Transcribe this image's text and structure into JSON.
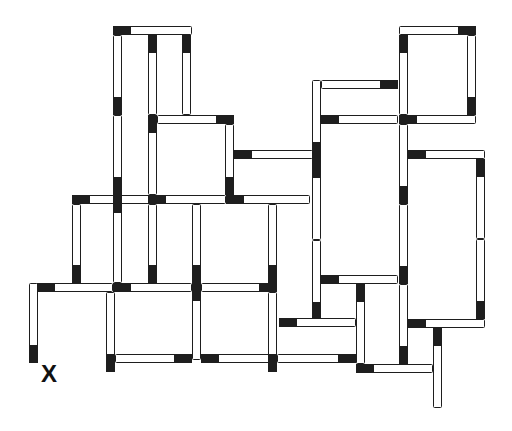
{
  "diagram": {
    "stick_thickness": 9,
    "head_length": 18,
    "colors": {
      "head": "#1e1e1e",
      "outline": "#1e1e1e",
      "body": "#ffffff",
      "background": "#ffffff"
    },
    "label": {
      "text": "X",
      "x": 41,
      "y": 362,
      "size": 24
    },
    "sticks": [
      {
        "x": 113,
        "y": 26,
        "w": 79,
        "h": 9,
        "head": "start"
      },
      {
        "x": 113,
        "y": 35,
        "w": 9,
        "h": 80,
        "head": "end"
      },
      {
        "x": 113,
        "y": 115,
        "w": 9,
        "h": 80,
        "head": "end"
      },
      {
        "x": 148,
        "y": 35,
        "w": 9,
        "h": 80,
        "head": "start"
      },
      {
        "x": 182,
        "y": 35,
        "w": 9,
        "h": 80,
        "head": "start"
      },
      {
        "x": 148,
        "y": 115,
        "w": 9,
        "h": 80,
        "head": "start"
      },
      {
        "x": 157,
        "y": 115,
        "w": 77,
        "h": 9,
        "head": "end"
      },
      {
        "x": 225,
        "y": 124,
        "w": 9,
        "h": 71,
        "head": "end"
      },
      {
        "x": 234,
        "y": 150,
        "w": 79,
        "h": 9,
        "head": "start"
      },
      {
        "x": 72,
        "y": 195,
        "w": 78,
        "h": 9,
        "head": "start"
      },
      {
        "x": 148,
        "y": 195,
        "w": 78,
        "h": 9,
        "head": "start"
      },
      {
        "x": 226,
        "y": 195,
        "w": 84,
        "h": 9,
        "head": "start"
      },
      {
        "x": 72,
        "y": 204,
        "w": 9,
        "h": 79,
        "head": "end"
      },
      {
        "x": 113,
        "y": 195,
        "w": 9,
        "h": 88,
        "head": "start"
      },
      {
        "x": 148,
        "y": 204,
        "w": 9,
        "h": 79,
        "head": "end"
      },
      {
        "x": 192,
        "y": 204,
        "w": 9,
        "h": 79,
        "head": "end"
      },
      {
        "x": 268,
        "y": 204,
        "w": 9,
        "h": 79,
        "head": "end"
      },
      {
        "x": 29,
        "y": 283,
        "w": 9,
        "h": 80,
        "head": "end"
      },
      {
        "x": 37,
        "y": 283,
        "w": 76,
        "h": 9,
        "head": "start"
      },
      {
        "x": 113,
        "y": 283,
        "w": 79,
        "h": 9,
        "head": "start"
      },
      {
        "x": 192,
        "y": 283,
        "w": 9,
        "h": 77,
        "head": "start"
      },
      {
        "x": 201,
        "y": 283,
        "w": 76,
        "h": 9,
        "head": "end"
      },
      {
        "x": 106,
        "y": 292,
        "w": 9,
        "h": 80,
        "head": "end"
      },
      {
        "x": 115,
        "y": 354,
        "w": 77,
        "h": 9,
        "head": "end"
      },
      {
        "x": 201,
        "y": 354,
        "w": 76,
        "h": 9,
        "head": "start"
      },
      {
        "x": 268,
        "y": 292,
        "w": 9,
        "h": 80,
        "head": "end"
      },
      {
        "x": 277,
        "y": 354,
        "w": 79,
        "h": 9,
        "head": "end"
      },
      {
        "x": 312,
        "y": 80,
        "w": 9,
        "h": 80,
        "head": "end"
      },
      {
        "x": 321,
        "y": 80,
        "w": 77,
        "h": 9,
        "head": "end"
      },
      {
        "x": 321,
        "y": 115,
        "w": 77,
        "h": 9,
        "head": "start"
      },
      {
        "x": 312,
        "y": 160,
        "w": 9,
        "h": 80,
        "head": "start"
      },
      {
        "x": 312,
        "y": 240,
        "w": 9,
        "h": 80,
        "head": "end"
      },
      {
        "x": 399,
        "y": 26,
        "w": 77,
        "h": 9,
        "head": "end"
      },
      {
        "x": 399,
        "y": 35,
        "w": 9,
        "h": 80,
        "head": "start"
      },
      {
        "x": 467,
        "y": 35,
        "w": 9,
        "h": 80,
        "head": "end"
      },
      {
        "x": 399,
        "y": 115,
        "w": 77,
        "h": 9,
        "head": "start"
      },
      {
        "x": 399,
        "y": 124,
        "w": 9,
        "h": 80,
        "head": "end"
      },
      {
        "x": 408,
        "y": 150,
        "w": 77,
        "h": 9,
        "head": "start"
      },
      {
        "x": 476,
        "y": 159,
        "w": 9,
        "h": 80,
        "head": "start"
      },
      {
        "x": 476,
        "y": 239,
        "w": 9,
        "h": 80,
        "head": "end"
      },
      {
        "x": 399,
        "y": 204,
        "w": 9,
        "h": 80,
        "head": "end"
      },
      {
        "x": 408,
        "y": 319,
        "w": 77,
        "h": 9,
        "head": "start"
      },
      {
        "x": 321,
        "y": 275,
        "w": 77,
        "h": 9,
        "head": "start"
      },
      {
        "x": 279,
        "y": 318,
        "w": 77,
        "h": 9,
        "head": "start"
      },
      {
        "x": 356,
        "y": 284,
        "w": 9,
        "h": 80,
        "head": "start"
      },
      {
        "x": 399,
        "y": 284,
        "w": 9,
        "h": 80,
        "head": "end"
      },
      {
        "x": 356,
        "y": 364,
        "w": 77,
        "h": 9,
        "head": "start"
      },
      {
        "x": 433,
        "y": 328,
        "w": 9,
        "h": 80,
        "head": "start"
      }
    ]
  }
}
